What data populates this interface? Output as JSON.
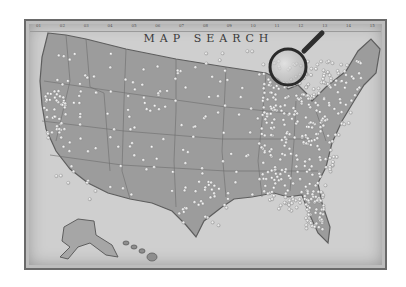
{
  "title": "MAP SEARCH",
  "ruler": [
    "01",
    "02",
    "03",
    "04",
    "05",
    "06",
    "07",
    "08",
    "09",
    "10",
    "11",
    "12",
    "13",
    "14",
    "15"
  ],
  "icons": {
    "magnifier": "magnifying-glass-icon"
  },
  "colors": {
    "background": "#ffffff",
    "map_paper": "#cfcfcf",
    "land": "#9c9c9c",
    "pin": "#f2f2f2",
    "frame": "#6a6a6a"
  }
}
